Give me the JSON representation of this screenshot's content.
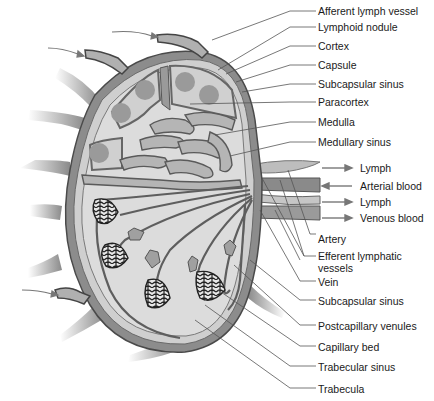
{
  "colors": {
    "capsule": "#8c8c8c",
    "cortex": "#d6d6d6",
    "nodule": "#9a9a9a",
    "sinus": "#a8a8a8",
    "vessel": "#707070",
    "leader": "#555555",
    "text": "#1a1a1a"
  },
  "labels": [
    {
      "id": "afferent-lymph-vessel",
      "text": "Afferent lymph vessel",
      "x": 318,
      "y": 6
    },
    {
      "id": "lymphoid-nodule",
      "text": "Lymphoid nodule",
      "x": 318,
      "y": 22
    },
    {
      "id": "cortex",
      "text": "Cortex",
      "x": 318,
      "y": 41
    },
    {
      "id": "capsule",
      "text": "Capsule",
      "x": 318,
      "y": 60
    },
    {
      "id": "subcapsular-sinus-top",
      "text": "Subcapsular sinus",
      "x": 318,
      "y": 79
    },
    {
      "id": "paracortex",
      "text": "Paracortex",
      "x": 318,
      "y": 97
    },
    {
      "id": "medulla",
      "text": "Medulla",
      "x": 318,
      "y": 117
    },
    {
      "id": "medullary-sinus",
      "text": "Medullary sinus",
      "x": 318,
      "y": 137
    },
    {
      "id": "lymph-1",
      "text": "Lymph",
      "x": 360,
      "y": 163
    },
    {
      "id": "arterial-blood",
      "text": "Arterial blood",
      "x": 360,
      "y": 181
    },
    {
      "id": "lymph-2",
      "text": "Lymph",
      "x": 360,
      "y": 197
    },
    {
      "id": "venous-blood",
      "text": "Venous blood",
      "x": 360,
      "y": 213
    },
    {
      "id": "artery",
      "text": "Artery",
      "x": 318,
      "y": 234
    },
    {
      "id": "efferent-lymphatic-vessels",
      "text": "Efferent lymphatic vessels",
      "x": 318,
      "y": 251
    },
    {
      "id": "vein",
      "text": "Vein",
      "x": 318,
      "y": 277
    },
    {
      "id": "subcapsular-sinus-bottom",
      "text": "Subcapsular sinus",
      "x": 318,
      "y": 296
    },
    {
      "id": "postcapillary-venules",
      "text": "Postcapillary venules",
      "x": 318,
      "y": 321
    },
    {
      "id": "capillary-bed",
      "text": "Capillary bed",
      "x": 318,
      "y": 342
    },
    {
      "id": "trabecular-sinus",
      "text": "Trabecular sinus",
      "x": 318,
      "y": 362
    },
    {
      "id": "trabecula",
      "text": "Trabecula",
      "x": 318,
      "y": 384
    }
  ],
  "flow_arrows": [
    {
      "label": "Lymph",
      "direction": "right"
    },
    {
      "label": "Arterial blood",
      "direction": "left"
    },
    {
      "label": "Lymph",
      "direction": "right"
    },
    {
      "label": "Venous blood",
      "direction": "right"
    }
  ]
}
